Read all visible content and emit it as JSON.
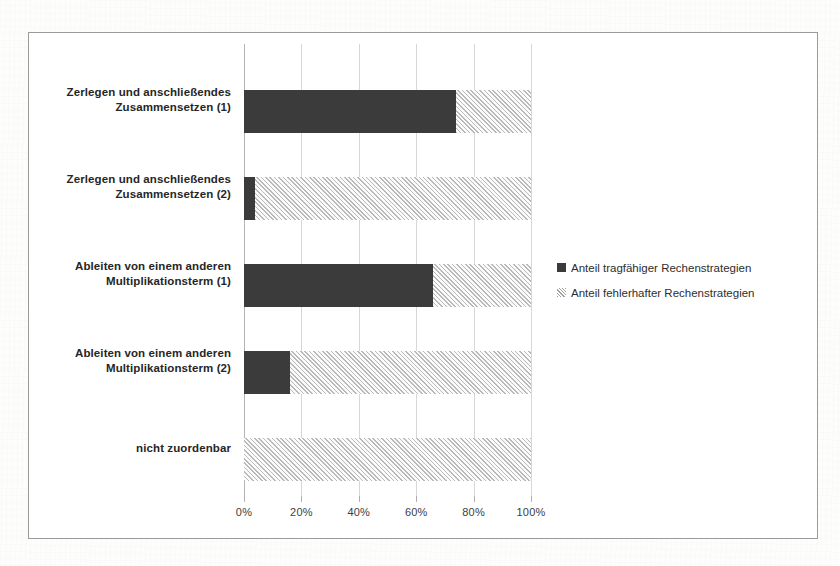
{
  "chart_data": {
    "type": "bar",
    "orientation": "horizontal",
    "stacked": true,
    "stacked_percent": true,
    "title": "",
    "subtitle": "",
    "xlabel": "",
    "ylabel": "",
    "xlim": [
      0,
      100
    ],
    "grid": true,
    "legend_position": "right",
    "categories": [
      "Zerlegen und anschließendes Zusammensetzen (1)",
      "Zerlegen und anschließendes Zusammensetzen (2)",
      "Ableiten von einem anderen Multiplikationsterm (1)",
      "Ableiten von einem anderen Multiplikationsterm (2)",
      "nicht zuordenbar"
    ],
    "category_lines": [
      [
        "Zerlegen und anschließendes",
        "Zusammensetzen (1)"
      ],
      [
        "Zerlegen und anschließendes",
        "Zusammensetzen (2)"
      ],
      [
        "Ableiten von einem anderen",
        "Multiplikationsterm (1)"
      ],
      [
        "Ableiten von einem anderen",
        "Multiplikationsterm (2)"
      ],
      [
        "nicht zuordenbar",
        ""
      ]
    ],
    "series": [
      {
        "name": "Anteil tragfähiger Rechenstrategien",
        "color": "#3b3b3b",
        "fill": "solid",
        "values": [
          74,
          4,
          66,
          16,
          0
        ]
      },
      {
        "name": "Anteil fehlerhafter Rechenstrategien",
        "color": "#b9b9b9",
        "fill": "hatched",
        "values": [
          26,
          96,
          34,
          84,
          100
        ]
      }
    ],
    "x_ticks": [
      0,
      20,
      40,
      60,
      80,
      100
    ],
    "x_tick_labels": [
      "0%",
      "20%",
      "40%",
      "60%",
      "80%",
      "100%"
    ]
  },
  "legend": {
    "items": [
      {
        "label": "Anteil tragfähiger Rechenstrategien",
        "swatch": "dark-square-icon"
      },
      {
        "label": "Anteil fehlerhafter Rechenstrategien",
        "swatch": "hatched-square-icon"
      }
    ]
  },
  "colors": {
    "bar_dark": "#3b3b3b",
    "bar_hatch": "#b9b9b9",
    "grid": "#d7d7d7",
    "frame_border": "#9a9a9a",
    "text": "#262626",
    "background": "#ffffff"
  }
}
